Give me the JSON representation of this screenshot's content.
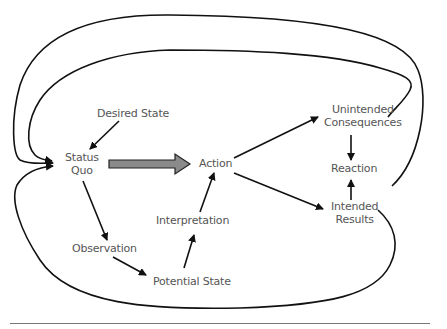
{
  "diagram": {
    "type": "flow",
    "nodes": {
      "desired_state": "Desired State",
      "status": "Status",
      "quo": "Quo",
      "action": "Action",
      "observation": "Observation",
      "potential_state": "Potential State",
      "interpretation": "Interpretation",
      "unintended_1": "Unintended",
      "unintended_2": "Consequences",
      "reaction": "Reaction",
      "intended_1": "Intended",
      "intended_2": "Results"
    },
    "edges": [
      {
        "from": "Desired State",
        "to": "Status Quo"
      },
      {
        "from": "Status Quo",
        "to": "Action",
        "style": "thick gray block arrow"
      },
      {
        "from": "Status Quo",
        "to": "Observation"
      },
      {
        "from": "Observation",
        "to": "Potential State"
      },
      {
        "from": "Potential State",
        "to": "Interpretation"
      },
      {
        "from": "Interpretation",
        "to": "Action"
      },
      {
        "from": "Action",
        "to": "Unintended Consequences"
      },
      {
        "from": "Action",
        "to": "Intended Results"
      },
      {
        "from": "Unintended Consequences",
        "to": "Reaction"
      },
      {
        "from": "Intended Results",
        "to": "Reaction"
      },
      {
        "from": "Unintended Consequences",
        "to": "Status Quo",
        "style": "large outer loop"
      },
      {
        "from": "Reaction",
        "to": "Status Quo",
        "style": "large outer loop"
      },
      {
        "from": "Intended Results",
        "to": "Status Quo",
        "style": "large lower loop"
      }
    ],
    "colors": {
      "line": "#111111",
      "text": "#555555",
      "block_arrow": "#8a8a8a"
    }
  }
}
